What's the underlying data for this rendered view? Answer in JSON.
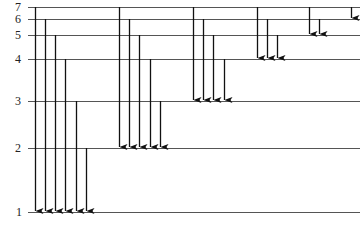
{
  "diagram": {
    "type": "energy-level-diagram",
    "line_color": "#555555",
    "arrow_color": "#111111",
    "levels": [
      {
        "n": "7",
        "y": 7
      },
      {
        "n": "6",
        "y": 19
      },
      {
        "n": "5",
        "y": 35
      },
      {
        "n": "4",
        "y": 59
      },
      {
        "n": "3",
        "y": 101
      },
      {
        "n": "2",
        "y": 148
      },
      {
        "n": "1",
        "y": 212
      }
    ],
    "transitions": [
      {
        "from": 7,
        "to": 1,
        "x": 35
      },
      {
        "from": 6,
        "to": 1,
        "x": 45
      },
      {
        "from": 5,
        "to": 1,
        "x": 55
      },
      {
        "from": 4,
        "to": 1,
        "x": 65
      },
      {
        "from": 3,
        "to": 1,
        "x": 76
      },
      {
        "from": 2,
        "to": 1,
        "x": 86
      },
      {
        "from": 7,
        "to": 2,
        "x": 119
      },
      {
        "from": 6,
        "to": 2,
        "x": 129
      },
      {
        "from": 5,
        "to": 2,
        "x": 139
      },
      {
        "from": 4,
        "to": 2,
        "x": 150
      },
      {
        "from": 3,
        "to": 2,
        "x": 160
      },
      {
        "from": 7,
        "to": 3,
        "x": 193
      },
      {
        "from": 6,
        "to": 3,
        "x": 203
      },
      {
        "from": 5,
        "to": 3,
        "x": 213
      },
      {
        "from": 4,
        "to": 3,
        "x": 224
      },
      {
        "from": 7,
        "to": 4,
        "x": 257
      },
      {
        "from": 6,
        "to": 4,
        "x": 267
      },
      {
        "from": 5,
        "to": 4,
        "x": 277
      },
      {
        "from": 7,
        "to": 5,
        "x": 309
      },
      {
        "from": 6,
        "to": 5,
        "x": 319
      },
      {
        "from": 7,
        "to": 6,
        "x": 351
      }
    ]
  }
}
